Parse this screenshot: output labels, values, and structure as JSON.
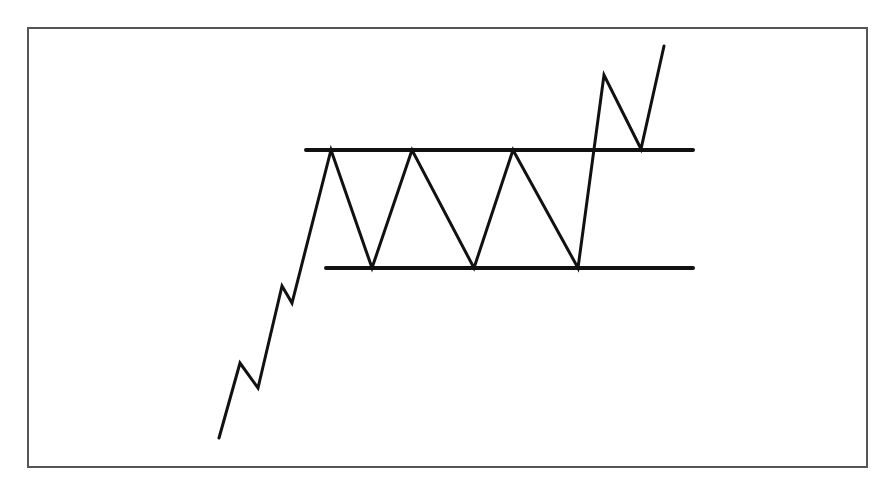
{
  "caption": {
    "text": "",
    "note": "clipped descenders only, unreadable"
  },
  "frame": {
    "x": 28,
    "y": 28,
    "width": 839,
    "height": 439,
    "stroke": "#555555"
  },
  "pattern": {
    "type": "rectangle-consolidation-breakout",
    "stroke": "#111111",
    "resistance": {
      "y": 150,
      "x1": 306,
      "x2": 693
    },
    "support": {
      "y": 268,
      "x1": 326,
      "x2": 693
    },
    "price_path": [
      [
        219,
        438
      ],
      [
        240,
        363
      ],
      [
        258,
        388
      ],
      [
        282,
        286
      ],
      [
        292,
        303
      ],
      [
        331,
        150
      ],
      [
        372,
        268
      ],
      [
        412,
        150
      ],
      [
        474,
        268
      ],
      [
        513,
        150
      ],
      [
        578,
        268
      ],
      [
        604,
        75
      ],
      [
        641,
        149
      ],
      [
        664,
        46
      ]
    ]
  }
}
